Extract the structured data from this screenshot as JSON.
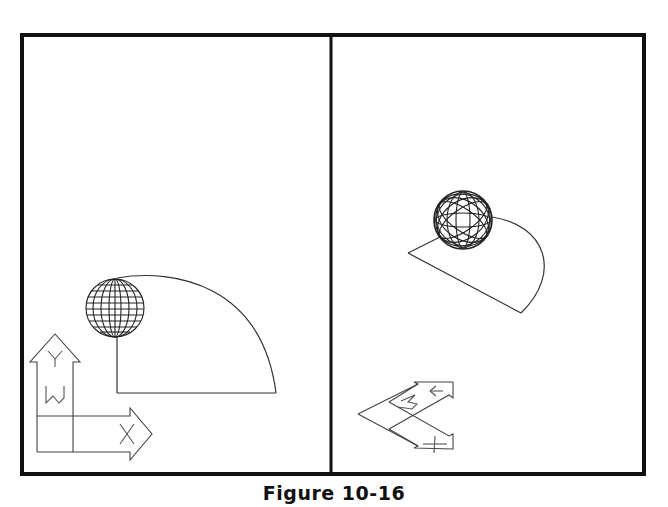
{
  "figure": {
    "caption": "Figure 10-16",
    "colors": {
      "frame": "#111111",
      "linework": "#222222",
      "background": "#ffffff"
    },
    "viewports": [
      {
        "id": "left",
        "view": "plan",
        "objects": [
          "wireframe-sphere",
          "quarter-round-region",
          "ucs-icon"
        ],
        "ucs_labels": [
          "Y",
          "W",
          "X"
        ]
      },
      {
        "id": "right",
        "view": "isometric",
        "objects": [
          "wireframe-sphere",
          "quarter-round-region",
          "ucs-icon"
        ],
        "ucs_labels": [
          "Y",
          "W",
          "X"
        ]
      }
    ]
  }
}
